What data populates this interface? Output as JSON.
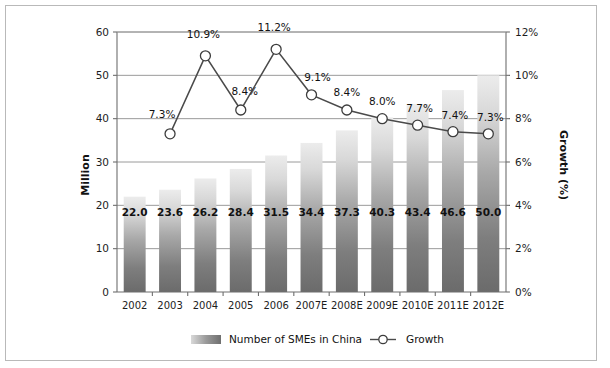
{
  "chart_data": {
    "type": "bar",
    "title": "",
    "subtitle": "",
    "categories": [
      "2002",
      "2003",
      "2004",
      "2005",
      "2006",
      "2007E",
      "2008E",
      "2009E",
      "2010E",
      "2011E",
      "2012E"
    ],
    "xlabel": "",
    "ylabel": "Million",
    "y2label": "Growth (%)",
    "ylim": [
      0,
      60
    ],
    "y2lim": [
      0,
      12
    ],
    "yticks": [
      "0",
      "10",
      "20",
      "30",
      "40",
      "50",
      "60"
    ],
    "ytick_values": [
      0,
      10,
      20,
      30,
      40,
      50,
      60
    ],
    "y2ticks": [
      "0%",
      "2%",
      "4%",
      "6%",
      "8%",
      "10%",
      "12%"
    ],
    "y2tick_values": [
      0,
      2,
      4,
      6,
      8,
      10,
      12
    ],
    "grid": true,
    "legend_position": "bottom",
    "series": [
      {
        "name": "Number of SMEs in China",
        "type": "bar",
        "axis": "left",
        "unit": "Million",
        "values": [
          22.0,
          23.6,
          26.2,
          28.4,
          31.5,
          34.4,
          37.3,
          40.3,
          43.4,
          46.6,
          50.0
        ],
        "labels": [
          "22.0",
          "23.6",
          "26.2",
          "28.4",
          "31.5",
          "34.4",
          "37.3",
          "40.3",
          "43.4",
          "46.6",
          "50.0"
        ],
        "color_top": "#e8e8e8",
        "color_bottom": "#707070"
      },
      {
        "name": "Growth",
        "type": "line",
        "axis": "right",
        "unit": "%",
        "values": [
          null,
          7.3,
          10.9,
          8.4,
          11.2,
          9.1,
          8.4,
          8.0,
          7.7,
          7.4,
          7.3
        ],
        "labels": [
          "",
          "7.3%",
          "10.9%",
          "8.4%",
          "11.2%",
          "9.1%",
          "8.4%",
          "8.0%",
          "7.7%",
          "7.4%",
          "7.3%"
        ],
        "color": "#4a4a4a",
        "marker": "circle-open"
      }
    ]
  },
  "legend": {
    "items": [
      {
        "label": "Number of SMEs in China",
        "marker": "gradient-swatch"
      },
      {
        "label": "Growth",
        "marker": "line-circle"
      }
    ]
  },
  "colors": {
    "frame_border": "#b9b9b9",
    "grid": "#9a9a9a",
    "axis": "#6e6e6e",
    "text": "#111111",
    "line": "#4a4a4a",
    "bar_top": "#e8e8e8",
    "bar_bottom": "#707070"
  }
}
